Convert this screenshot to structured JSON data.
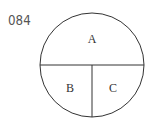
{
  "problem_number": "084",
  "diagram": {
    "shape": "circle divided into three regions",
    "regions": [
      {
        "label": "A",
        "position": "upper half"
      },
      {
        "label": "B",
        "position": "lower-left quarter"
      },
      {
        "label": "C",
        "position": "lower-right quarter"
      }
    ],
    "stroke_color": "#333333",
    "label_color": "#333333"
  }
}
